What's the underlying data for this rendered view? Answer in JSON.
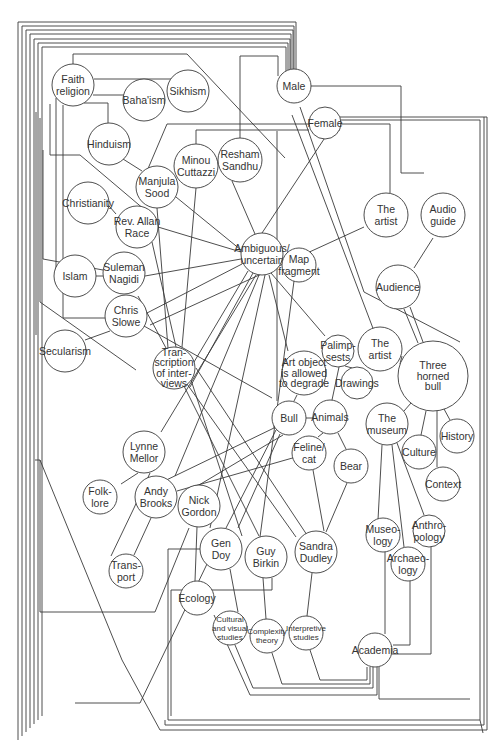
{
  "diagram": {
    "type": "concept-network",
    "line_color": "#3a3a3a",
    "background": "#ffffff",
    "nodes": [
      {
        "id": "faith",
        "lines": [
          "Faith",
          "religion"
        ],
        "x": 73,
        "y": 85,
        "r": 21
      },
      {
        "id": "bahaism",
        "lines": [
          "Baha'ism"
        ],
        "x": 144,
        "y": 100,
        "r": 21
      },
      {
        "id": "sikhism",
        "lines": [
          "Sikhism"
        ],
        "x": 188,
        "y": 91,
        "r": 21
      },
      {
        "id": "hinduism",
        "lines": [
          "Hinduism"
        ],
        "x": 109,
        "y": 144,
        "r": 21
      },
      {
        "id": "minou",
        "lines": [
          "Minou",
          "Cuttazzi"
        ],
        "x": 196,
        "y": 166,
        "r": 22
      },
      {
        "id": "resham",
        "lines": [
          "Resham",
          "Sandhu"
        ],
        "x": 240,
        "y": 160,
        "r": 22
      },
      {
        "id": "male",
        "lines": [
          "Male"
        ],
        "x": 294,
        "y": 86,
        "r": 17
      },
      {
        "id": "female",
        "lines": [
          "Female"
        ],
        "x": 325,
        "y": 123,
        "r": 16
      },
      {
        "id": "manjula",
        "lines": [
          "Manjula",
          "Sood"
        ],
        "x": 157,
        "y": 187,
        "r": 21
      },
      {
        "id": "christianity",
        "lines": [
          "Christianity"
        ],
        "x": 88,
        "y": 203,
        "r": 21
      },
      {
        "id": "rev",
        "lines": [
          "Rev. Allan",
          "Race"
        ],
        "x": 137,
        "y": 227,
        "r": 21
      },
      {
        "id": "ambiguous",
        "lines": [
          "Ambiguous/",
          "uncertain"
        ],
        "x": 262,
        "y": 254,
        "r": 21
      },
      {
        "id": "mapfrag",
        "lines": [
          "Map",
          "fragment"
        ],
        "x": 299,
        "y": 265,
        "r": 17
      },
      {
        "id": "suleman",
        "lines": [
          "Suleman",
          "Nagidi"
        ],
        "x": 124,
        "y": 273,
        "r": 21
      },
      {
        "id": "islam",
        "lines": [
          "Islam"
        ],
        "x": 75,
        "y": 276,
        "r": 21
      },
      {
        "id": "theartist1",
        "lines": [
          "The",
          "artist"
        ],
        "x": 386,
        "y": 215,
        "r": 22
      },
      {
        "id": "audioguide",
        "lines": [
          "Audio",
          "guide"
        ],
        "x": 443,
        "y": 215,
        "r": 22
      },
      {
        "id": "audience",
        "lines": [
          "Audience"
        ],
        "x": 398,
        "y": 287,
        "r": 22
      },
      {
        "id": "chris",
        "lines": [
          "Chris",
          "Slowe"
        ],
        "x": 126,
        "y": 316,
        "r": 21
      },
      {
        "id": "secularism",
        "lines": [
          "Secularism"
        ],
        "x": 65,
        "y": 351,
        "r": 21
      },
      {
        "id": "transcription",
        "lines": [
          "Tran-",
          "scription",
          "of inter-",
          "views"
        ],
        "x": 174,
        "y": 368,
        "r": 21
      },
      {
        "id": "palimpsests",
        "lines": [
          "Palimp-",
          "sests"
        ],
        "x": 338,
        "y": 351,
        "r": 16
      },
      {
        "id": "artobject",
        "lines": [
          "Art object",
          "is allowed",
          "to degrade"
        ],
        "x": 304,
        "y": 373,
        "r": 22
      },
      {
        "id": "drawings",
        "lines": [
          "Drawings"
        ],
        "x": 357,
        "y": 383,
        "r": 16
      },
      {
        "id": "theartist2",
        "lines": [
          "The",
          "artist"
        ],
        "x": 380,
        "y": 349,
        "r": 22
      },
      {
        "id": "threehorned",
        "lines": [
          "Three",
          "horned",
          "bull"
        ],
        "x": 433,
        "y": 376,
        "r": 35
      },
      {
        "id": "bull",
        "lines": [
          "Bull"
        ],
        "x": 289,
        "y": 418,
        "r": 17
      },
      {
        "id": "animals",
        "lines": [
          "Animals"
        ],
        "x": 330,
        "y": 417,
        "r": 17
      },
      {
        "id": "themuseum",
        "lines": [
          "The",
          "museum"
        ],
        "x": 387,
        "y": 424,
        "r": 21
      },
      {
        "id": "history",
        "lines": [
          "History"
        ],
        "x": 457,
        "y": 436,
        "r": 17
      },
      {
        "id": "culture",
        "lines": [
          "Culture"
        ],
        "x": 419,
        "y": 452,
        "r": 17
      },
      {
        "id": "lynne",
        "lines": [
          "Lynne",
          "Mellor"
        ],
        "x": 144,
        "y": 452,
        "r": 21
      },
      {
        "id": "feline",
        "lines": [
          "Feline/",
          "cat"
        ],
        "x": 309,
        "y": 453,
        "r": 17
      },
      {
        "id": "bear",
        "lines": [
          "Bear"
        ],
        "x": 351,
        "y": 466,
        "r": 17
      },
      {
        "id": "context",
        "lines": [
          "Context"
        ],
        "x": 443,
        "y": 484,
        "r": 17
      },
      {
        "id": "folklore",
        "lines": [
          "Folk-",
          "lore"
        ],
        "x": 100,
        "y": 497,
        "r": 17
      },
      {
        "id": "andy",
        "lines": [
          "Andy",
          "Brooks"
        ],
        "x": 156,
        "y": 497,
        "r": 21
      },
      {
        "id": "nick",
        "lines": [
          "Nick",
          "Gordon"
        ],
        "x": 199,
        "y": 506,
        "r": 21
      },
      {
        "id": "gendoy",
        "lines": [
          "Gen",
          "Doy"
        ],
        "x": 221,
        "y": 549,
        "r": 21
      },
      {
        "id": "guybirkin",
        "lines": [
          "Guy",
          "Birkin"
        ],
        "x": 266,
        "y": 557,
        "r": 21
      },
      {
        "id": "sandra",
        "lines": [
          "Sandra",
          "Dudley"
        ],
        "x": 316,
        "y": 552,
        "r": 21
      },
      {
        "id": "museology",
        "lines": [
          "Museo-",
          "logy"
        ],
        "x": 383,
        "y": 535,
        "r": 17
      },
      {
        "id": "anthropology",
        "lines": [
          "Anthro-",
          "pology"
        ],
        "x": 429,
        "y": 531,
        "r": 16
      },
      {
        "id": "archaeology",
        "lines": [
          "Archaeo-",
          "logy"
        ],
        "x": 408,
        "y": 564,
        "r": 17
      },
      {
        "id": "transport",
        "lines": [
          "Trans-",
          "port"
        ],
        "x": 126,
        "y": 571,
        "r": 17
      },
      {
        "id": "ecology",
        "lines": [
          "Ecology"
        ],
        "x": 197,
        "y": 598,
        "r": 17
      },
      {
        "id": "cultural",
        "lines": [
          "Cultural",
          "and visual",
          "studies"
        ],
        "x": 230,
        "y": 628,
        "r": 17,
        "small": true
      },
      {
        "id": "complexity",
        "lines": [
          "Complexity",
          "theory"
        ],
        "x": 267,
        "y": 636,
        "r": 17,
        "small": true
      },
      {
        "id": "interpretive",
        "lines": [
          "Interpretive",
          "studies"
        ],
        "x": 306,
        "y": 633,
        "r": 17,
        "small": true
      },
      {
        "id": "academia",
        "lines": [
          "Academia"
        ],
        "x": 375,
        "y": 650,
        "r": 17
      }
    ],
    "edges": [
      "M73,64 L73,54 L187,54 L285,158",
      "M94,79 L173,79",
      "M93,95 L125,95",
      "M84,103 L108,103 L108,123",
      "M123,159 L142,171",
      "M63,105 L63,318 L105,318",
      "M56,98 L56,283",
      "M50,104 L50,155 L80,155 L145,210",
      "M43,150 L43,259 L103,270",
      "M40,118 L40,302 L136,370",
      "M36,112 L36,335",
      "M103,199 L116,214",
      "M96,276 L103,276",
      "M85,340 L110,331",
      "M147,171 L167,124 L390,124 L390,193",
      "M196,144 L196,130 L309,130",
      "M240,138 L240,56 L278,56 L278,76",
      "M157,208 L168,348",
      "M176,197 L241,250",
      "M196,188 L182,347",
      "M158,227 L241,252",
      "M232,181 L255,234",
      "M145,276 L241,259",
      "M147,313 L242,264",
      "M138,296 L166,348",
      "M144,326 L272,398",
      "M152,242 L176,347",
      "M280,258 L282,258",
      "M248,271 L178,389",
      "M253,273 L190,387",
      "M256,275 L161,432",
      "M259,275 L175,476",
      "M265,275 L210,528",
      "M271,273 L325,336",
      "M269,275 L288,351",
      "M294,281 L260,537",
      "M277,131 L277,401",
      "M300,107 L364,292 L460,342",
      "M303,100 L303,86 L401,86 L401,173 L424,173",
      "M364,227 L150,325",
      "M433,238 L414,268",
      "M404,309 L418,343",
      "M410,307 L423,342",
      "M292,115 L374,331",
      "M262,233 L330,130 L340,130",
      "M402,356 L400,364",
      "M345,366 L352,368",
      "M339,367 L332,400",
      "M297,395 L294,401",
      "M274,423 L274,428 L154,486",
      "M306,418 L313,418",
      "M276,430 L226,528",
      "M280,434 L238,528",
      "M283,435 L199,485",
      "M323,433 L318,437",
      "M338,433 L346,449",
      "M313,470 L324,531",
      "M347,483 L326,532",
      "M310,453 L177,491",
      "M404,411 L411,403",
      "M426,411 L421,435",
      "M437,411 L437,467",
      "M444,409 L450,420",
      "M382,445 L378,520",
      "M392,445 L404,547",
      "M397,443 L424,515",
      "M385,552 L385,634",
      "M410,581 L410,645 L393,645",
      "M431,547 L431,654 L392,654",
      "M191,380 L242,536",
      "M187,384 L296,537",
      "M184,386 L259,536",
      "M196,368 L307,535",
      "M138,473 L121,484",
      "M150,473 L134,508 L111,556",
      "M151,518 L134,555",
      "M189,528 L155,612 L40,612 L40,460 L35,460",
      "M197,527 L195,581",
      "M230,569 L238,612",
      "M207,564 L140,703 L75,703",
      "M263,578 L266,619",
      "M272,578 L272,590 L171,590 L171,716",
      "M214,615 L250,695 L377,695 L377,667",
      "M235,645 L253,688 L373,688 L373,667",
      "M272,653 L282,684 L370,684 L370,667",
      "M310,650 L320,680 L367,680 L367,667",
      "M312,573 L307,616",
      "M200,549 L168,549 L168,720 L480,720 L480,120 L341,120",
      "M165,720 L165,725 L484,725 L484,117",
      "M340,117 L487,117 L487,730 L160,730 L122,660 L40,460",
      "M379,667 L379,699 L470,699",
      "M480,720 L483,733"
    ],
    "frame_lines": [
      {
        "left": 18,
        "top": 22,
        "right": 296
      },
      {
        "left": 22,
        "top": 26,
        "right": 294
      },
      {
        "left": 26,
        "top": 30,
        "right": 293
      },
      {
        "left": 30,
        "top": 34,
        "right": 291
      },
      {
        "left": 34,
        "top": 39,
        "right": 290
      },
      {
        "left": 38,
        "top": 43,
        "right": 288
      },
      {
        "left": 42,
        "top": 47,
        "right": 286
      }
    ]
  }
}
